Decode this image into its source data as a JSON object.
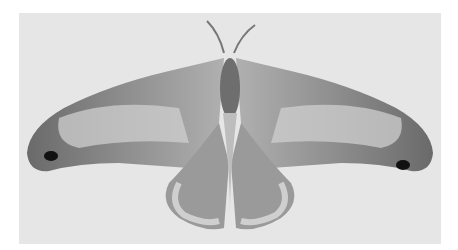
{
  "image": {
    "subject": "moth specimen with snake-head-like forewing tips, wings spread",
    "style": "grayscale photograph",
    "colors": {
      "background": "#e6e6e6",
      "page": "#ffffff",
      "wing_dark": "#5a5a5a",
      "wing_mid": "#8c8c8c",
      "wing_light": "#cfcfcf",
      "eyespot": "#111111"
    }
  }
}
